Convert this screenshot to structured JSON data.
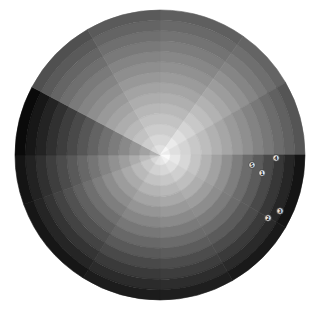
{
  "chart_data": {
    "type": "polar-area",
    "title": "",
    "center": [
      160,
      155
    ],
    "radius": 145,
    "rings": 14,
    "sectors": [
      {
        "start": -90,
        "end": -55,
        "inner": 225,
        "outer": 95
      },
      {
        "start": -55,
        "end": -30,
        "inner": 245,
        "outer": 100
      },
      {
        "start": -30,
        "end": 0,
        "inner": 235,
        "outer": 85
      },
      {
        "start": 0,
        "end": 30,
        "inner": 250,
        "outer": 20
      },
      {
        "start": 30,
        "end": 60,
        "inner": 240,
        "outer": 25
      },
      {
        "start": 60,
        "end": 90,
        "inner": 230,
        "outer": 30
      },
      {
        "start": 90,
        "end": 122,
        "inner": 225,
        "outer": 28
      },
      {
        "start": 122,
        "end": 160,
        "inner": 215,
        "outer": 22
      },
      {
        "start": 160,
        "end": 180,
        "inner": 200,
        "outer": 20
      },
      {
        "start": 180,
        "end": 208,
        "inner": 175,
        "outer": 10
      },
      {
        "start": 208,
        "end": 240,
        "inner": 215,
        "outer": 80
      },
      {
        "start": 240,
        "end": 270,
        "inner": 225,
        "outer": 90
      }
    ],
    "markers": [
      {
        "label": "1",
        "x": 262,
        "y": 173
      },
      {
        "label": "2",
        "x": 268,
        "y": 218
      },
      {
        "label": "3",
        "x": 280,
        "y": 211
      },
      {
        "label": "4",
        "x": 276,
        "y": 158
      },
      {
        "label": "5",
        "x": 252,
        "y": 165
      }
    ],
    "colors": {
      "background": "#ffffff",
      "marker_fill": "#e8e8e8",
      "marker_stroke": "#333333"
    }
  }
}
